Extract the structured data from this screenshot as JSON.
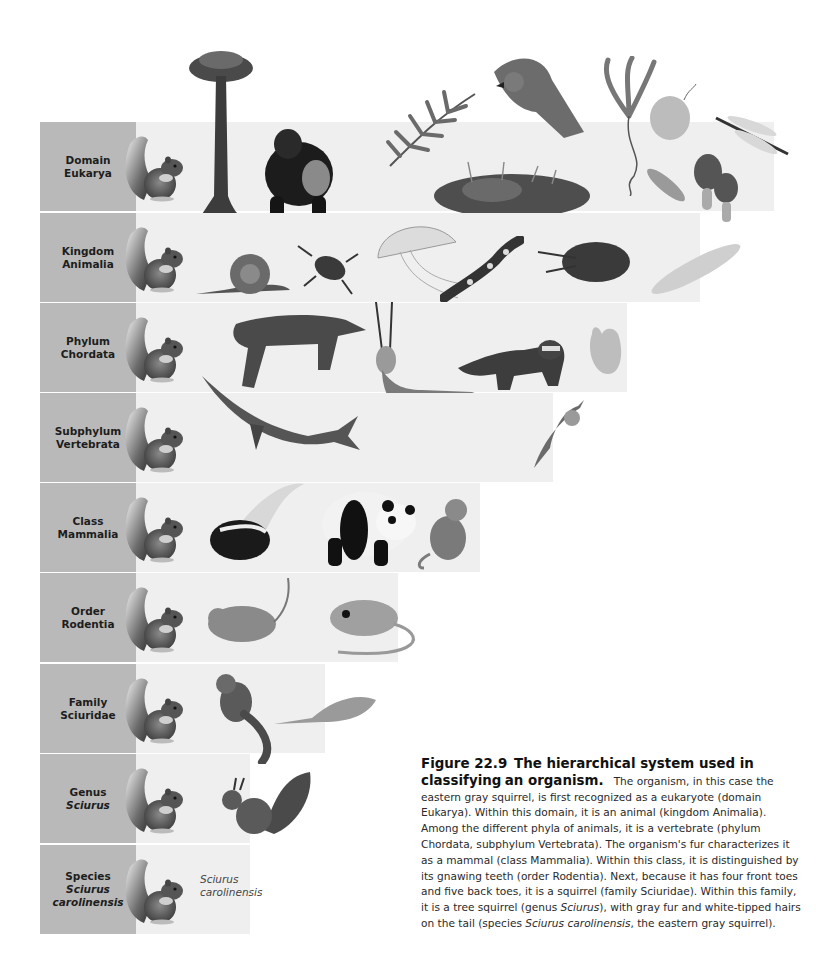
{
  "figure": {
    "number": "Figure 22.9",
    "title_line1": "The hierarchical system used in classifying",
    "title_line2": "an organism.",
    "caption_parts": {
      "p1": "The organism, in this case the eastern gray squirrel, is first recognized as a eukaryote (domain Eukarya). Within this domain, it is an animal (kingdom Animalia). Among the different phyla of animals, it is a vertebrate (phylum Chordata, subphylum Vertebrata). The organism's fur characterizes it as a mammal (class Mammalia). Within this class, it is distinguished by its gnawing teeth (order Rodentia). Next, because it has four front toes and five back toes, it is a squirrel (family Sciuridae). Within this family, it is a tree squirrel (genus ",
      "genus_italic": "Sciurus",
      "p2": "), with gray fur and white-tipped hairs on the tail (species ",
      "species_italic": "Sciurus carolinensis",
      "p3": ", the eastern gray squirrel)."
    }
  },
  "colors": {
    "label_bg": "#b9b9b9",
    "panel_bg": "#efefef",
    "text": "#231f20"
  },
  "rows": [
    {
      "rank": "Domain",
      "name": "Eukarya",
      "name_italic": false,
      "organisms": [
        "tree",
        "gorilla",
        "fern",
        "hawk",
        "kelp",
        "protist-cell",
        "dragonfly",
        "moss",
        "paramecium",
        "morel-mushroom"
      ]
    },
    {
      "rank": "Kingdom",
      "name": "Animalia",
      "name_italic": false,
      "organisms": [
        "snail",
        "beetle",
        "jellyfish",
        "salamander",
        "crayfish",
        "flatworm"
      ]
    },
    {
      "rank": "Phylum",
      "name": "Chordata",
      "name_italic": false,
      "organisms": [
        "coyote",
        "oryx",
        "raccoon",
        "sea-squirt"
      ]
    },
    {
      "rank": "Subphylum",
      "name": "Vertebrata",
      "name_italic": false,
      "organisms": [
        "whale",
        "oryx",
        "warbler"
      ]
    },
    {
      "rank": "Class",
      "name": "Mammalia",
      "name_italic": false,
      "organisms": [
        "skunk",
        "panda",
        "monkey"
      ]
    },
    {
      "rank": "Order",
      "name": "Rodentia",
      "name_italic": false,
      "organisms": [
        "mouse",
        "kangaroo-rat"
      ]
    },
    {
      "rank": "Family",
      "name": "Sciuridae",
      "name_italic": false,
      "organisms": [
        "chipmunk",
        "flying-squirrel"
      ]
    },
    {
      "rank": "Genus",
      "name": "Sciurus",
      "name_italic": true,
      "organisms": [
        "red-squirrel"
      ]
    },
    {
      "rank": "Species",
      "name": "Sciurus",
      "name2": "carolinensis",
      "name_italic": true,
      "organisms": [],
      "species_label": [
        "Sciurus",
        "carolinensis"
      ]
    }
  ]
}
